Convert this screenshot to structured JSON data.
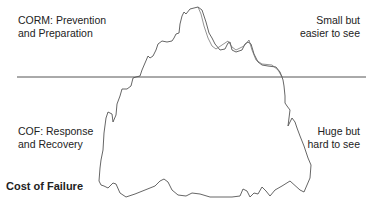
{
  "diagram": {
    "title": "Cost of Failure",
    "above_water": {
      "left_label": "CORM: Prevention\nand Preparation",
      "right_label": "Small but\neasier  to see"
    },
    "below_water": {
      "left_label": "COF: Response\nand Recovery",
      "right_label": "Huge but\nhard to see"
    },
    "shape": "iceberg",
    "colors": {
      "line": "#555555",
      "text": "#222222",
      "background": "#ffffff"
    }
  }
}
